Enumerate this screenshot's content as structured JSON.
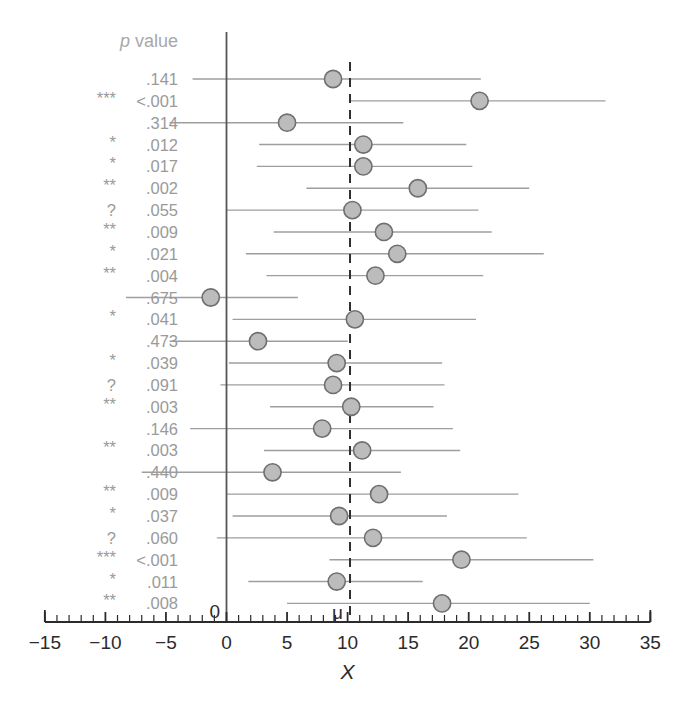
{
  "header": {
    "pvalue_label_italic": "p",
    "pvalue_label_rest": " value"
  },
  "annotations": {
    "zero_label": "0",
    "mu_label": "μ"
  },
  "chart_data": {
    "type": "scatter",
    "subtype": "forest-plot",
    "title": "",
    "xlabel": "X",
    "ylabel": "",
    "xlim": [
      -15,
      35
    ],
    "ylim": [
      0,
      24
    ],
    "grid": false,
    "legend": "none",
    "x_ticks": [
      -15,
      -10,
      -5,
      0,
      5,
      10,
      15,
      20,
      25,
      30,
      35
    ],
    "x_tick_labels": [
      "−15",
      "−10",
      "−5",
      "0",
      "5",
      "10",
      "15",
      "20",
      "25",
      "30",
      "35"
    ],
    "minor_tick_step": 1,
    "reference_lines": [
      {
        "name": "zero",
        "x": 0,
        "style": "solid",
        "label": "0"
      },
      {
        "name": "mu",
        "x": 10.2,
        "style": "dashed",
        "label": "μ"
      }
    ],
    "row_label_header": "p value",
    "series": [
      {
        "name": "estimate",
        "marker": "circle",
        "color": "#bcbcbc",
        "edge_color": "#6f6f6f"
      },
      {
        "name": "confidence-interval",
        "style": "line",
        "color": "#9e9e9e"
      }
    ],
    "rows": [
      {
        "stars": "",
        "p_value": ".141",
        "estimate": 8.8,
        "ci_low": -2.8,
        "ci_high": 21.0
      },
      {
        "stars": "***",
        "p_value": "<.001",
        "estimate": 20.9,
        "ci_low": 10.2,
        "ci_high": 31.3
      },
      {
        "stars": "",
        "p_value": ".314",
        "estimate": 5.0,
        "ci_low": -4.7,
        "ci_high": 14.6
      },
      {
        "stars": "*",
        "p_value": ".012",
        "estimate": 11.3,
        "ci_low": 2.7,
        "ci_high": 19.8
      },
      {
        "stars": "*",
        "p_value": ".017",
        "estimate": 11.3,
        "ci_low": 2.5,
        "ci_high": 20.3
      },
      {
        "stars": "**",
        "p_value": ".002",
        "estimate": 15.8,
        "ci_low": 6.6,
        "ci_high": 25.0
      },
      {
        "stars": "?",
        "p_value": ".055",
        "estimate": 10.4,
        "ci_low": 0.0,
        "ci_high": 20.8
      },
      {
        "stars": "**",
        "p_value": ".009",
        "estimate": 13.0,
        "ci_low": 3.9,
        "ci_high": 21.9
      },
      {
        "stars": "*",
        "p_value": ".021",
        "estimate": 14.1,
        "ci_low": 1.6,
        "ci_high": 26.2
      },
      {
        "stars": "**",
        "p_value": ".004",
        "estimate": 12.3,
        "ci_low": 3.3,
        "ci_high": 21.2
      },
      {
        "stars": "",
        "p_value": ".675",
        "estimate": -1.3,
        "ci_low": -8.3,
        "ci_high": 5.9
      },
      {
        "stars": "*",
        "p_value": ".041",
        "estimate": 10.6,
        "ci_low": 0.5,
        "ci_high": 20.6
      },
      {
        "stars": "",
        "p_value": ".473",
        "estimate": 2.6,
        "ci_low": -4.7,
        "ci_high": 10.0
      },
      {
        "stars": "*",
        "p_value": ".039",
        "estimate": 9.1,
        "ci_low": 0.2,
        "ci_high": 17.8
      },
      {
        "stars": "?",
        "p_value": ".091",
        "estimate": 8.8,
        "ci_low": -0.5,
        "ci_high": 18.0
      },
      {
        "stars": "**",
        "p_value": ".003",
        "estimate": 10.3,
        "ci_low": 3.6,
        "ci_high": 17.1
      },
      {
        "stars": "",
        "p_value": ".146",
        "estimate": 7.9,
        "ci_low": -3.0,
        "ci_high": 18.7
      },
      {
        "stars": "**",
        "p_value": ".003",
        "estimate": 11.2,
        "ci_low": 3.1,
        "ci_high": 19.3
      },
      {
        "stars": "",
        "p_value": ".440",
        "estimate": 3.8,
        "ci_low": -7.0,
        "ci_high": 14.4
      },
      {
        "stars": "**",
        "p_value": ".009",
        "estimate": 12.6,
        "ci_low": 0.0,
        "ci_high": 24.1
      },
      {
        "stars": "*",
        "p_value": ".037",
        "estimate": 9.3,
        "ci_low": 0.5,
        "ci_high": 18.2
      },
      {
        "stars": "?",
        "p_value": ".060",
        "estimate": 12.1,
        "ci_low": -0.8,
        "ci_high": 24.8
      },
      {
        "stars": "***",
        "p_value": "<.001",
        "estimate": 19.4,
        "ci_low": 8.5,
        "ci_high": 30.3
      },
      {
        "stars": "*",
        "p_value": ".011",
        "estimate": 9.1,
        "ci_low": 1.8,
        "ci_high": 16.2
      },
      {
        "stars": "**",
        "p_value": ".008",
        "estimate": 17.8,
        "ci_low": 5.0,
        "ci_high": 30.0
      }
    ]
  }
}
